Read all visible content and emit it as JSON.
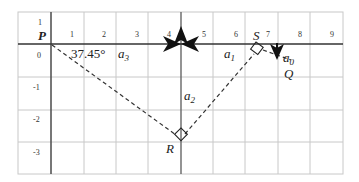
{
  "diagram": {
    "x_ticks": [
      "1",
      "2",
      "3",
      "4",
      "5",
      "6",
      "7",
      "8",
      "9"
    ],
    "y_ticks": [
      "1",
      "0",
      "-1",
      "-2",
      "-3"
    ],
    "points": {
      "P": "P",
      "S": "S",
      "Q": "Q",
      "R": "R"
    },
    "vectors": {
      "a0": {
        "base": "a",
        "sub": "0"
      },
      "a1": {
        "base": "a",
        "sub": "1"
      },
      "a2": {
        "base": "a",
        "sub": "2"
      },
      "a3": {
        "base": "a",
        "sub": "3"
      }
    },
    "angle_label": "37.45°",
    "colors": {
      "grid": "#c8c8c8",
      "axis": "#555555",
      "vector": "#111111",
      "dashed": "#333333"
    }
  }
}
